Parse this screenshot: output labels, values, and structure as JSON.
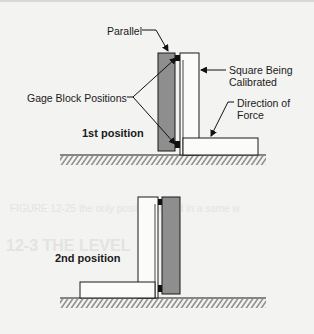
{
  "figure_top": {
    "labels": {
      "parallel": "Parallel",
      "square_line1": "Square Being",
      "square_line2": "Calibrated",
      "gage_blocks": "Gage Block Positions",
      "force_line1": "Direction of",
      "force_line2": "Force",
      "position": "1st position"
    }
  },
  "figure_bottom": {
    "labels": {
      "position": "2nd position"
    }
  },
  "bleed_through": {
    "caption_fragment": "FIGURE 12-25 the only position placed in a same w",
    "heading_fragment": "12-3  THE LEVEL"
  },
  "colors": {
    "parallel_fill": "#8e8e8e",
    "square_fill": "#fbfbfa",
    "outline": "#1a1a1a",
    "gage_block": "#111111",
    "background": "#f3f3f1"
  }
}
